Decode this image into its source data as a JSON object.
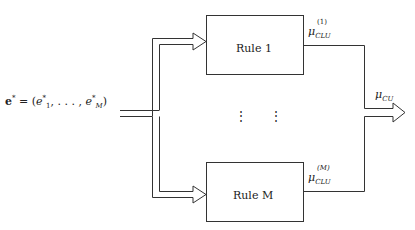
{
  "diagram": {
    "input": {
      "symbol": "e*",
      "equation_lhs": "e",
      "equation_lhs_sup": "*",
      "equation_rhs_prefix": " = (",
      "first_elem": "e",
      "first_elem_sup": "*",
      "first_elem_sub": "1",
      "ellipsis": ", . . . , ",
      "last_elem": "e",
      "last_elem_sup": "*",
      "last_elem_sub": "M",
      "close_paren": ")"
    },
    "rules": [
      {
        "label": "Rule 1",
        "output_symbol": "μ",
        "output_sub": "CLU",
        "output_sup": "(1)"
      },
      {
        "label": "Rule M",
        "output_symbol": "μ",
        "output_sub": "CLU",
        "output_sup": "(M)"
      }
    ],
    "ellipsis_vertical": [
      "⋮",
      "⋮"
    ],
    "output": {
      "symbol": "μ",
      "sub": "CU"
    },
    "colors": {
      "line": "#333333",
      "background": "#ffffff"
    }
  }
}
